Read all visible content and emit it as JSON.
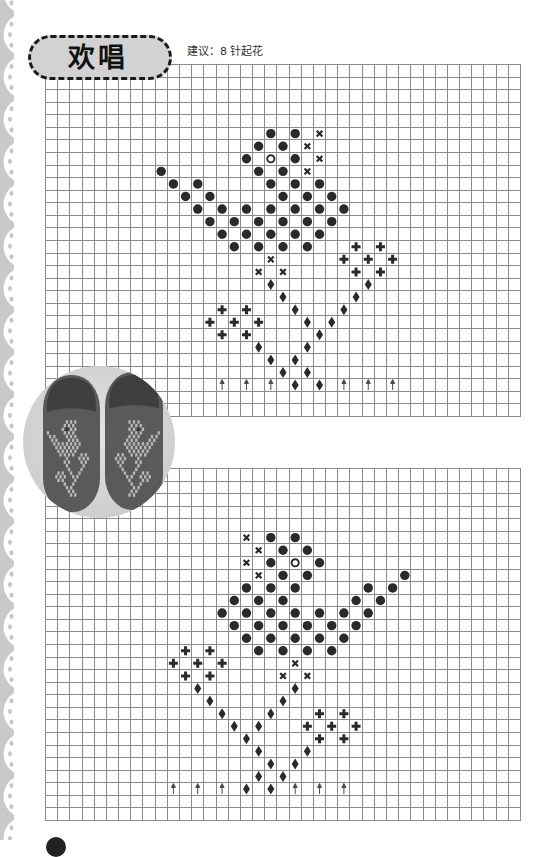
{
  "page": {
    "title": "欢唱",
    "suggestion": "建议：8 针起花"
  },
  "colors": {
    "grid_line": "#8a8a8a",
    "symbol": "#2a2a2a",
    "arrow": "#4a4a4a",
    "title_fill": "#d2d2d2",
    "title_border": "#1a1a1a",
    "lace_border": "#c9c9c9",
    "photo_background": "#d6d6d6",
    "slipper": "#5a5a5a",
    "slipper_pattern": "#b9b9b9",
    "slipper_eye": "#2e2e2e"
  },
  "symbol_legend": {
    "dot": "filled-circle-icon",
    "open": "open-circle-icon",
    "x": "cross-mark-icon",
    "plus": "plus-icon",
    "diamond": "diamond-icon",
    "arrow": "up-arrow-icon"
  },
  "charts": [
    {
      "cols": 39,
      "rows": 28,
      "symbols": [
        [
          5,
          18,
          "dot"
        ],
        [
          5,
          20,
          "dot"
        ],
        [
          5,
          22,
          "x"
        ],
        [
          6,
          17,
          "dot"
        ],
        [
          6,
          19,
          "dot"
        ],
        [
          6,
          21,
          "x"
        ],
        [
          7,
          16,
          "dot"
        ],
        [
          7,
          18,
          "open"
        ],
        [
          7,
          20,
          "dot"
        ],
        [
          7,
          22,
          "x"
        ],
        [
          8,
          9,
          "dot"
        ],
        [
          8,
          17,
          "dot"
        ],
        [
          8,
          19,
          "dot"
        ],
        [
          8,
          21,
          "x"
        ],
        [
          9,
          10,
          "dot"
        ],
        [
          9,
          12,
          "dot"
        ],
        [
          9,
          18,
          "dot"
        ],
        [
          9,
          20,
          "dot"
        ],
        [
          9,
          22,
          "dot"
        ],
        [
          10,
          11,
          "dot"
        ],
        [
          10,
          13,
          "dot"
        ],
        [
          10,
          19,
          "dot"
        ],
        [
          10,
          21,
          "dot"
        ],
        [
          10,
          23,
          "dot"
        ],
        [
          11,
          12,
          "dot"
        ],
        [
          11,
          14,
          "dot"
        ],
        [
          11,
          16,
          "dot"
        ],
        [
          11,
          18,
          "dot"
        ],
        [
          11,
          20,
          "dot"
        ],
        [
          11,
          22,
          "dot"
        ],
        [
          11,
          24,
          "dot"
        ],
        [
          12,
          13,
          "dot"
        ],
        [
          12,
          15,
          "dot"
        ],
        [
          12,
          17,
          "dot"
        ],
        [
          12,
          19,
          "dot"
        ],
        [
          12,
          21,
          "dot"
        ],
        [
          12,
          23,
          "dot"
        ],
        [
          13,
          14,
          "dot"
        ],
        [
          13,
          16,
          "dot"
        ],
        [
          13,
          18,
          "dot"
        ],
        [
          13,
          20,
          "dot"
        ],
        [
          13,
          22,
          "dot"
        ],
        [
          14,
          15,
          "dot"
        ],
        [
          14,
          17,
          "dot"
        ],
        [
          14,
          19,
          "dot"
        ],
        [
          14,
          21,
          "dot"
        ],
        [
          14,
          25,
          "plus"
        ],
        [
          14,
          27,
          "plus"
        ],
        [
          15,
          18,
          "x"
        ],
        [
          15,
          24,
          "plus"
        ],
        [
          15,
          26,
          "plus"
        ],
        [
          15,
          28,
          "plus"
        ],
        [
          16,
          17,
          "x"
        ],
        [
          16,
          19,
          "x"
        ],
        [
          16,
          25,
          "plus"
        ],
        [
          16,
          27,
          "plus"
        ],
        [
          17,
          18,
          "diamond"
        ],
        [
          17,
          26,
          "diamond"
        ],
        [
          18,
          19,
          "diamond"
        ],
        [
          18,
          25,
          "diamond"
        ],
        [
          19,
          14,
          "plus"
        ],
        [
          19,
          16,
          "plus"
        ],
        [
          19,
          20,
          "diamond"
        ],
        [
          19,
          24,
          "diamond"
        ],
        [
          20,
          13,
          "plus"
        ],
        [
          20,
          15,
          "plus"
        ],
        [
          20,
          17,
          "plus"
        ],
        [
          20,
          21,
          "diamond"
        ],
        [
          20,
          23,
          "diamond"
        ],
        [
          21,
          14,
          "plus"
        ],
        [
          21,
          16,
          "plus"
        ],
        [
          21,
          22,
          "diamond"
        ],
        [
          22,
          17,
          "diamond"
        ],
        [
          22,
          21,
          "diamond"
        ],
        [
          23,
          18,
          "diamond"
        ],
        [
          23,
          20,
          "diamond"
        ],
        [
          24,
          19,
          "diamond"
        ],
        [
          24,
          21,
          "diamond"
        ],
        [
          25,
          14,
          "arrow"
        ],
        [
          25,
          16,
          "arrow"
        ],
        [
          25,
          18,
          "arrow"
        ],
        [
          25,
          20,
          "diamond"
        ],
        [
          25,
          22,
          "diamond"
        ],
        [
          25,
          24,
          "arrow"
        ],
        [
          25,
          26,
          "arrow"
        ],
        [
          25,
          28,
          "arrow"
        ]
      ]
    },
    {
      "cols": 39,
      "rows": 28,
      "symbols": [
        [
          5,
          16,
          "x"
        ],
        [
          5,
          18,
          "dot"
        ],
        [
          5,
          20,
          "dot"
        ],
        [
          6,
          17,
          "x"
        ],
        [
          6,
          19,
          "dot"
        ],
        [
          6,
          21,
          "dot"
        ],
        [
          7,
          16,
          "x"
        ],
        [
          7,
          18,
          "dot"
        ],
        [
          7,
          20,
          "open"
        ],
        [
          7,
          22,
          "dot"
        ],
        [
          8,
          17,
          "x"
        ],
        [
          8,
          19,
          "dot"
        ],
        [
          8,
          21,
          "dot"
        ],
        [
          8,
          29,
          "dot"
        ],
        [
          9,
          16,
          "dot"
        ],
        [
          9,
          18,
          "dot"
        ],
        [
          9,
          20,
          "dot"
        ],
        [
          9,
          26,
          "dot"
        ],
        [
          9,
          28,
          "dot"
        ],
        [
          10,
          15,
          "dot"
        ],
        [
          10,
          17,
          "dot"
        ],
        [
          10,
          19,
          "dot"
        ],
        [
          10,
          25,
          "dot"
        ],
        [
          10,
          27,
          "dot"
        ],
        [
          11,
          14,
          "dot"
        ],
        [
          11,
          16,
          "dot"
        ],
        [
          11,
          18,
          "dot"
        ],
        [
          11,
          20,
          "dot"
        ],
        [
          11,
          22,
          "dot"
        ],
        [
          11,
          24,
          "dot"
        ],
        [
          11,
          26,
          "dot"
        ],
        [
          12,
          15,
          "dot"
        ],
        [
          12,
          17,
          "dot"
        ],
        [
          12,
          19,
          "dot"
        ],
        [
          12,
          21,
          "dot"
        ],
        [
          12,
          23,
          "dot"
        ],
        [
          12,
          25,
          "dot"
        ],
        [
          13,
          16,
          "dot"
        ],
        [
          13,
          18,
          "dot"
        ],
        [
          13,
          20,
          "dot"
        ],
        [
          13,
          22,
          "dot"
        ],
        [
          13,
          24,
          "dot"
        ],
        [
          14,
          11,
          "plus"
        ],
        [
          14,
          13,
          "plus"
        ],
        [
          14,
          17,
          "dot"
        ],
        [
          14,
          19,
          "dot"
        ],
        [
          14,
          21,
          "dot"
        ],
        [
          14,
          23,
          "dot"
        ],
        [
          15,
          10,
          "plus"
        ],
        [
          15,
          12,
          "plus"
        ],
        [
          15,
          14,
          "plus"
        ],
        [
          15,
          20,
          "x"
        ],
        [
          16,
          11,
          "plus"
        ],
        [
          16,
          13,
          "plus"
        ],
        [
          16,
          19,
          "x"
        ],
        [
          16,
          21,
          "x"
        ],
        [
          17,
          12,
          "diamond"
        ],
        [
          17,
          20,
          "diamond"
        ],
        [
          18,
          13,
          "diamond"
        ],
        [
          18,
          19,
          "diamond"
        ],
        [
          19,
          14,
          "diamond"
        ],
        [
          19,
          18,
          "diamond"
        ],
        [
          19,
          22,
          "plus"
        ],
        [
          19,
          24,
          "plus"
        ],
        [
          20,
          15,
          "diamond"
        ],
        [
          20,
          17,
          "diamond"
        ],
        [
          20,
          21,
          "plus"
        ],
        [
          20,
          23,
          "plus"
        ],
        [
          20,
          25,
          "plus"
        ],
        [
          21,
          16,
          "diamond"
        ],
        [
          21,
          22,
          "plus"
        ],
        [
          21,
          24,
          "plus"
        ],
        [
          22,
          17,
          "diamond"
        ],
        [
          22,
          21,
          "diamond"
        ],
        [
          23,
          18,
          "diamond"
        ],
        [
          23,
          20,
          "diamond"
        ],
        [
          24,
          17,
          "diamond"
        ],
        [
          24,
          19,
          "diamond"
        ],
        [
          25,
          10,
          "arrow"
        ],
        [
          25,
          12,
          "arrow"
        ],
        [
          25,
          14,
          "arrow"
        ],
        [
          25,
          16,
          "diamond"
        ],
        [
          25,
          18,
          "diamond"
        ],
        [
          25,
          20,
          "arrow"
        ],
        [
          25,
          22,
          "arrow"
        ],
        [
          25,
          24,
          "arrow"
        ]
      ]
    }
  ]
}
